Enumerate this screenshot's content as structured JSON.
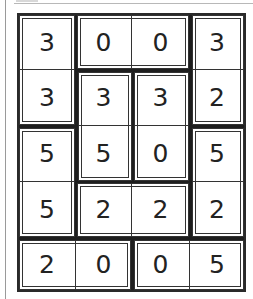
{
  "puzzle": {
    "rows": 5,
    "cols": 4,
    "cells": [
      [
        "3",
        "0",
        "0",
        "3"
      ],
      [
        "3",
        "3",
        "3",
        "2"
      ],
      [
        "5",
        "5",
        "0",
        "5"
      ],
      [
        "5",
        "2",
        "2",
        "2"
      ],
      [
        "2",
        "0",
        "0",
        "5"
      ]
    ],
    "regions": [
      {
        "cells": [
          [
            0,
            0
          ],
          [
            1,
            0
          ]
        ]
      },
      {
        "cells": [
          [
            0,
            1
          ],
          [
            0,
            2
          ]
        ]
      },
      {
        "cells": [
          [
            0,
            3
          ],
          [
            1,
            3
          ]
        ]
      },
      {
        "cells": [
          [
            1,
            1
          ],
          [
            2,
            1
          ]
        ]
      },
      {
        "cells": [
          [
            1,
            2
          ],
          [
            2,
            2
          ]
        ]
      },
      {
        "cells": [
          [
            2,
            0
          ],
          [
            3,
            0
          ]
        ]
      },
      {
        "cells": [
          [
            2,
            3
          ],
          [
            3,
            3
          ]
        ]
      },
      {
        "cells": [
          [
            3,
            1
          ],
          [
            3,
            2
          ]
        ]
      },
      {
        "cells": [
          [
            4,
            0
          ],
          [
            4,
            1
          ]
        ]
      },
      {
        "cells": [
          [
            4,
            2
          ],
          [
            4,
            3
          ]
        ]
      }
    ]
  }
}
